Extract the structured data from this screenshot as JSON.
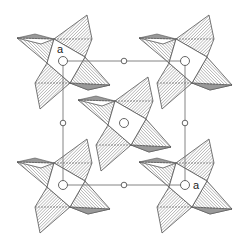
{
  "diagram": {
    "type": "crystal-structure-projection",
    "colors": {
      "line": "#555555",
      "hatch": "#666666",
      "shade": "#888888",
      "cell": "#777777"
    },
    "unit_cell": {
      "x1": 63,
      "y1": 61,
      "x2": 185,
      "y2": 185
    },
    "clusters": [
      {
        "id": "top-left",
        "cx": 63,
        "cy": 61
      },
      {
        "id": "top-right",
        "cx": 185,
        "cy": 61
      },
      {
        "id": "center",
        "cx": 124,
        "cy": 123
      },
      {
        "id": "bottom-left",
        "cx": 63,
        "cy": 185
      },
      {
        "id": "bottom-right",
        "cx": 185,
        "cy": 185
      }
    ],
    "labels": [
      {
        "text": "a",
        "x": 57,
        "y": 53
      },
      {
        "text": "a",
        "x": 194,
        "y": 189
      }
    ]
  }
}
